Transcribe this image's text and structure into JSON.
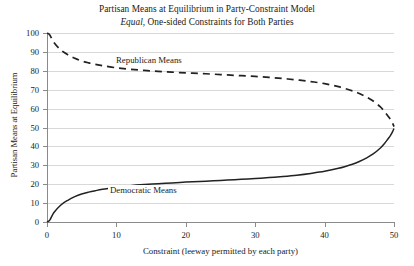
{
  "chart_data": {
    "type": "line",
    "title": "Partisan Means at Equilibrium in Party-Constraint Model",
    "subtitle_italic": "Equal",
    "subtitle_rest": ", One-sided Constraints for Both Parties",
    "xlabel": "Constraint (leeway permitted by each party)",
    "ylabel": "Partisan Means at Equilibrium",
    "xlim": [
      0,
      50
    ],
    "ylim": [
      0,
      100
    ],
    "xticks": [
      0,
      10,
      20,
      30,
      40,
      50
    ],
    "yticks": [
      0,
      10,
      20,
      30,
      40,
      50,
      60,
      70,
      80,
      90,
      100
    ],
    "grid": true,
    "grid_axis": "y",
    "legend": "inline-annotations",
    "series": [
      {
        "name": "Republican Means",
        "style": "dashed",
        "color": "#222222",
        "x": [
          0,
          0.4,
          1,
          2,
          3,
          4,
          5,
          6,
          7,
          8,
          10,
          12,
          14,
          16,
          18,
          20,
          22,
          24,
          26,
          28,
          30,
          32,
          34,
          36,
          38,
          40,
          42,
          44,
          45,
          46,
          47,
          48,
          48.6,
          49.1,
          49.5,
          49.8,
          50
        ],
        "y": [
          100,
          99,
          95,
          91,
          88.5,
          86.6,
          85.2,
          84.2,
          83.4,
          82.7,
          81.6,
          80.8,
          80.2,
          79.7,
          79.3,
          78.9,
          78.6,
          78.2,
          77.8,
          77.4,
          77,
          76.5,
          75.9,
          75.2,
          74.3,
          73.2,
          71.6,
          69.4,
          68,
          66.2,
          64,
          61,
          58.6,
          56.2,
          54.2,
          52.2,
          50.5
        ]
      },
      {
        "name": "Democratic Means",
        "style": "solid",
        "color": "#222222",
        "x": [
          0,
          0.4,
          1,
          2,
          3,
          4,
          5,
          6,
          7,
          8,
          10,
          12,
          14,
          16,
          18,
          20,
          22,
          24,
          26,
          28,
          30,
          32,
          34,
          36,
          38,
          40,
          42,
          44,
          45,
          46,
          47,
          48,
          48.6,
          49.1,
          49.5,
          49.8,
          50
        ],
        "y": [
          0,
          1,
          5,
          9,
          11.5,
          13.4,
          14.8,
          15.8,
          16.6,
          17.3,
          18.4,
          19.2,
          19.8,
          20.3,
          20.7,
          21.1,
          21.4,
          21.8,
          22.2,
          22.6,
          23,
          23.5,
          24.1,
          24.8,
          25.7,
          26.8,
          28.4,
          30.6,
          32,
          33.8,
          36,
          39,
          41.4,
          43.8,
          45.8,
          47.8,
          49.5
        ]
      }
    ],
    "annotations": [
      {
        "text": "Republican Means",
        "x": 10,
        "y": 83
      },
      {
        "text": "Democratic Means",
        "x": 9,
        "y": 18
      }
    ]
  },
  "axis": {
    "ytick_labels": [
      "100",
      "90",
      "80",
      "70",
      "60",
      "50",
      "40",
      "30",
      "20",
      "10",
      "0"
    ],
    "xtick_labels": [
      "0",
      "10",
      "20",
      "30",
      "40",
      "50"
    ]
  },
  "colors": {
    "grid": "#d8d8d8",
    "axis": "#8a8a8a",
    "line": "#222222",
    "text": "#1a1a1a",
    "background": "#ffffff"
  }
}
